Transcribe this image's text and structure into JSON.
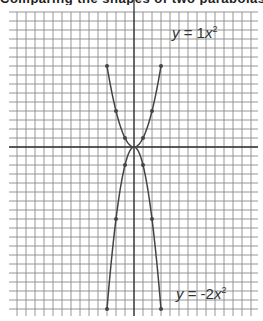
{
  "caption": "Comparing the shapes of two parabolas",
  "chart_data": {
    "type": "line",
    "title": "",
    "xlabel": "",
    "ylabel": "",
    "xlim": [
      -14,
      14
    ],
    "ylim": [
      -19,
      15
    ],
    "grid": true,
    "series": [
      {
        "name": "y = 1x²",
        "label_prefix": "y",
        "label_eq": " = 1",
        "label_var": "x",
        "label_exp": "2",
        "label_position": "top-right",
        "x": [
          -3,
          -2,
          -1,
          0,
          1,
          2,
          3
        ],
        "y": [
          9,
          4,
          1,
          0,
          1,
          4,
          9
        ]
      },
      {
        "name": "y = -2x²",
        "label_prefix": "y",
        "label_eq": " = -2",
        "label_var": "x",
        "label_exp": "2",
        "label_position": "bottom-right",
        "x": [
          -3,
          -2,
          -1,
          0,
          1,
          2,
          3
        ],
        "y": [
          -18,
          -8,
          -2,
          0,
          -2,
          -8,
          -18
        ]
      }
    ],
    "colors": {
      "grid": "#8a8a8a",
      "axis": "#333333",
      "curve": "#444444",
      "label": "#333333"
    }
  }
}
